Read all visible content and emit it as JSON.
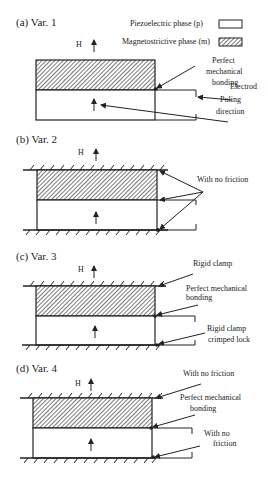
{
  "legend": {
    "piezo_label": "Piezoelectric phase (p)",
    "magneto_label": "Magnetostrictive phase (m)"
  },
  "field_label": "H",
  "panels": [
    {
      "title": "(a) Var. 1",
      "annotations": {
        "bonding_line1": "Perfect",
        "bonding_line2": "mechanical",
        "bonding_line3": "bonding",
        "electrode": "Electrod",
        "poling_line1": "Poling",
        "poling_line2": "direction"
      }
    },
    {
      "title": "(b) Var. 2",
      "annotations": {
        "friction": "With no friction"
      }
    },
    {
      "title": "(c) Var. 3",
      "annotations": {
        "clamp": "Rigid clamp",
        "bonding_line1": "Perfect mechanical",
        "bonding_line2": "bonding",
        "crimp_line1": "Rigid clamp",
        "crimp_line2": "crimped lock"
      }
    },
    {
      "title": "(d) Var. 4",
      "annotations": {
        "friction_top": "With no friction",
        "bonding_line1": "Perfect mechanical",
        "bonding_line2": "bonding",
        "friction_bottom_line1": "With no",
        "friction_bottom_line2": "friction"
      }
    }
  ],
  "colors": {
    "line": "#222222",
    "background": "#ffffff"
  }
}
